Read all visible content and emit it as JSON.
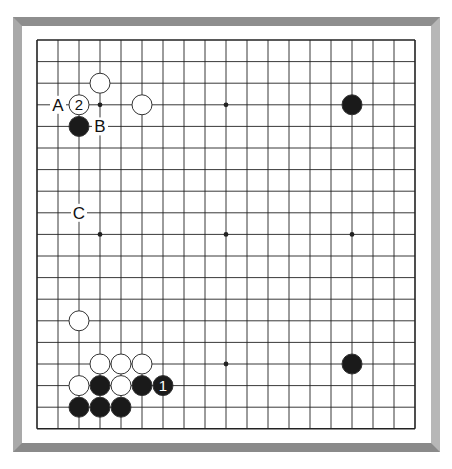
{
  "diagram": {
    "type": "go-board",
    "size": 19,
    "grid": {
      "x0": 37,
      "y0": 40,
      "dx": 21,
      "dy": 21.6
    },
    "colors": {
      "line": "#222222",
      "black_stone": "#1a1a1a",
      "white_stone": "#ffffff",
      "stone_outline": "#333333",
      "frame_light": "#b7b7b7",
      "frame_dark": "#8a8a8a"
    },
    "star_points": [
      [
        3,
        3
      ],
      [
        9,
        3
      ],
      [
        15,
        3
      ],
      [
        3,
        9
      ],
      [
        9,
        9
      ],
      [
        15,
        9
      ],
      [
        3,
        15
      ],
      [
        9,
        15
      ],
      [
        15,
        15
      ]
    ],
    "stones": [
      {
        "color": "white",
        "col": 3,
        "row": 2
      },
      {
        "color": "white",
        "col": 2,
        "row": 3,
        "label": "2"
      },
      {
        "color": "white",
        "col": 5,
        "row": 3
      },
      {
        "color": "black",
        "col": 2,
        "row": 4
      },
      {
        "color": "black",
        "col": 15,
        "row": 3
      },
      {
        "color": "white",
        "col": 2,
        "row": 13
      },
      {
        "color": "white",
        "col": 3,
        "row": 15
      },
      {
        "color": "white",
        "col": 4,
        "row": 15
      },
      {
        "color": "white",
        "col": 5,
        "row": 15
      },
      {
        "color": "black",
        "col": 15,
        "row": 15
      },
      {
        "color": "white",
        "col": 2,
        "row": 16
      },
      {
        "color": "black",
        "col": 3,
        "row": 16
      },
      {
        "color": "white",
        "col": 4,
        "row": 16
      },
      {
        "color": "black",
        "col": 5,
        "row": 16
      },
      {
        "color": "black",
        "col": 6,
        "row": 16,
        "label": "1"
      },
      {
        "color": "black",
        "col": 2,
        "row": 17
      },
      {
        "color": "black",
        "col": 3,
        "row": 17
      },
      {
        "color": "black",
        "col": 4,
        "row": 17
      }
    ],
    "letter_labels": [
      {
        "text": "A",
        "col": 1,
        "row": 3
      },
      {
        "text": "B",
        "col": 3,
        "row": 4
      },
      {
        "text": "C",
        "col": 2,
        "row": 8
      }
    ]
  }
}
